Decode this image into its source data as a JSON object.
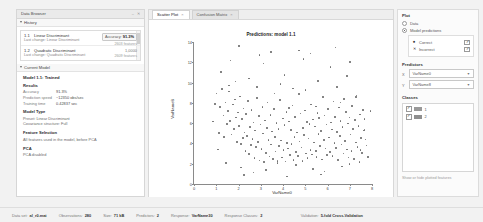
{
  "browser": {
    "title": "Data Browser",
    "history_header": "History",
    "history": [
      {
        "id": "1.1",
        "name": "Linear Discriminant",
        "sub_label": "Last change:",
        "sub_value": "Linear Discriminant",
        "accuracy_label": "Accuracy:",
        "accuracy_value": "91.3%",
        "features": "2603 features"
      },
      {
        "id": "1.2",
        "name": "Quadratic Discriminant",
        "sub_label": "Last change:",
        "sub_value": "Quadratic Discriminant",
        "accuracy_label": "",
        "accuracy_value": "1,0000",
        "features": "2609 features"
      }
    ],
    "current_model_header": "Current Model",
    "model_title": "Model 1.1: Trained",
    "results_header": "Results",
    "results": [
      {
        "key": "Accuracy",
        "value": "91.3%"
      },
      {
        "key": "Prediction speed",
        "value": "~12350 obs/sec"
      },
      {
        "key": "Training time",
        "value": "0.42837 sec"
      }
    ],
    "model_type_header": "Model Type",
    "model_type_lines": [
      "Preset: Linear Discriminant",
      "Covariance structure: Full"
    ],
    "feature_selection_header": "Feature Selection",
    "feature_selection_lines": [
      "All features used in the model, before PCA"
    ],
    "pca_header": "PCA",
    "pca_lines": [
      "PCA disabled"
    ]
  },
  "tabs": [
    {
      "label": "Scatter Plot",
      "close": "×",
      "active": true
    },
    {
      "label": "Confusion Matrix",
      "close": "×",
      "active": false
    }
  ],
  "chart_data": {
    "type": "scatter",
    "title": "Predictions: model 1.1",
    "xlabel": "VarName0",
    "ylabel": "VarName8",
    "xlim": [
      0,
      8
    ],
    "ylim": [
      0,
      14
    ],
    "xticks": [
      "0",
      "1",
      "2",
      "3",
      "4",
      "5",
      "6",
      "7",
      "8"
    ],
    "yticks": [
      "0",
      "2",
      "4",
      "6",
      "8",
      "10",
      "12",
      "14"
    ],
    "grid": false,
    "legend": "none",
    "series": [
      {
        "name": "Model predictions",
        "marker": "dot",
        "color": "#4a4a4a",
        "points": [
          [
            1.02,
            8.91
          ],
          [
            1.18,
            7.62
          ],
          [
            1.26,
            9.38
          ],
          [
            1.33,
            6.74
          ],
          [
            1.41,
            8.05
          ],
          [
            1.47,
            5.93
          ],
          [
            1.52,
            7.18
          ],
          [
            1.58,
            9.72
          ],
          [
            1.63,
            6.21
          ],
          [
            1.69,
            4.88
          ],
          [
            1.74,
            7.85
          ],
          [
            1.79,
            5.42
          ],
          [
            1.84,
            8.33
          ],
          [
            1.88,
            6.57
          ],
          [
            1.93,
            4.16
          ],
          [
            1.97,
            7.04
          ],
          [
            2.02,
            5.71
          ],
          [
            2.06,
            8.62
          ],
          [
            2.11,
            3.95
          ],
          [
            2.15,
            6.38
          ],
          [
            2.19,
            4.52
          ],
          [
            2.23,
            7.46
          ],
          [
            2.27,
            5.09
          ],
          [
            2.31,
            3.27
          ],
          [
            2.35,
            6.91
          ],
          [
            2.39,
            4.74
          ],
          [
            2.43,
            8.18
          ],
          [
            2.47,
            2.96
          ],
          [
            2.51,
            5.63
          ],
          [
            2.55,
            3.84
          ],
          [
            2.59,
            7.29
          ],
          [
            2.63,
            4.41
          ],
          [
            2.67,
            6.05
          ],
          [
            2.71,
            2.58
          ],
          [
            2.75,
            5.27
          ],
          [
            2.79,
            3.62
          ],
          [
            2.83,
            8.47
          ],
          [
            2.87,
            4.13
          ],
          [
            2.91,
            6.72
          ],
          [
            2.95,
            2.31
          ],
          [
            2.99,
            5.88
          ],
          [
            3.03,
            3.45
          ],
          [
            3.07,
            7.61
          ],
          [
            3.11,
            4.97
          ],
          [
            3.15,
            2.14
          ],
          [
            3.19,
            6.26
          ],
          [
            3.23,
            3.08
          ],
          [
            3.27,
            5.52
          ],
          [
            3.31,
            8.04
          ],
          [
            3.35,
            4.35
          ],
          [
            3.39,
            2.72
          ],
          [
            3.43,
            6.83
          ],
          [
            3.47,
            3.91
          ],
          [
            3.51,
            5.16
          ],
          [
            3.55,
            2.47
          ],
          [
            3.59,
            7.38
          ],
          [
            3.63,
            4.62
          ],
          [
            3.67,
            3.19
          ],
          [
            3.71,
            6.01
          ],
          [
            3.75,
            2.05
          ],
          [
            3.79,
            5.44
          ],
          [
            3.83,
            3.73
          ],
          [
            3.87,
            8.26
          ],
          [
            3.91,
            4.28
          ],
          [
            3.95,
            2.63
          ],
          [
            3.99,
            6.47
          ],
          [
            4.03,
            3.36
          ],
          [
            4.07,
            5.79
          ],
          [
            4.11,
            2.21
          ],
          [
            4.15,
            7.12
          ],
          [
            4.19,
            4.05
          ],
          [
            4.23,
            3.52
          ],
          [
            4.27,
            6.18
          ],
          [
            4.31,
            2.84
          ],
          [
            4.35,
            5.31
          ],
          [
            4.39,
            3.97
          ],
          [
            4.43,
            7.73
          ],
          [
            4.47,
            2.39
          ],
          [
            4.51,
            4.66
          ],
          [
            4.55,
            6.59
          ],
          [
            4.59,
            3.14
          ],
          [
            4.63,
            5.07
          ],
          [
            4.67,
            2.76
          ],
          [
            4.71,
            8.85
          ],
          [
            4.75,
            4.19
          ],
          [
            4.79,
            6.94
          ],
          [
            4.83,
            3.61
          ],
          [
            4.87,
            2.28
          ],
          [
            4.91,
            5.55
          ],
          [
            4.95,
            4.83
          ],
          [
            4.99,
            7.26
          ],
          [
            5.03,
            3.02
          ],
          [
            5.07,
            6.11
          ],
          [
            5.11,
            2.55
          ],
          [
            5.15,
            4.47
          ],
          [
            5.19,
            5.92
          ],
          [
            5.23,
            3.38
          ],
          [
            5.27,
            7.84
          ],
          [
            5.31,
            2.92
          ],
          [
            5.35,
            6.35
          ],
          [
            5.39,
            4.09
          ],
          [
            5.43,
            5.68
          ],
          [
            5.47,
            3.24
          ],
          [
            5.51,
            2.66
          ],
          [
            5.55,
            7.02
          ],
          [
            5.59,
            4.91
          ],
          [
            5.63,
            6.48
          ],
          [
            5.67,
            3.77
          ],
          [
            5.71,
            5.23
          ],
          [
            5.75,
            2.41
          ],
          [
            5.79,
            8.59
          ],
          [
            5.83,
            4.34
          ],
          [
            5.87,
            6.77
          ],
          [
            5.91,
            3.49
          ],
          [
            5.95,
            5.86
          ],
          [
            5.99,
            2.87
          ],
          [
            6.03,
            7.41
          ],
          [
            6.07,
            4.58
          ],
          [
            6.11,
            3.13
          ],
          [
            6.15,
            6.05
          ],
          [
            6.19,
            5.39
          ],
          [
            6.23,
            2.74
          ],
          [
            6.27,
            8.12
          ],
          [
            6.31,
            4.02
          ],
          [
            6.35,
            6.63
          ],
          [
            6.39,
            3.56
          ],
          [
            6.43,
            5.14
          ],
          [
            6.47,
            2.35
          ],
          [
            6.51,
            7.55
          ],
          [
            6.55,
            4.76
          ],
          [
            6.59,
            6.22
          ],
          [
            6.63,
            3.88
          ],
          [
            6.67,
            5.61
          ],
          [
            6.71,
            2.99
          ],
          [
            6.75,
            8.38
          ],
          [
            6.79,
            4.25
          ],
          [
            6.83,
            7.09
          ],
          [
            6.87,
            3.42
          ],
          [
            6.91,
            5.97
          ],
          [
            6.95,
            2.61
          ],
          [
            6.99,
            6.54
          ],
          [
            7.03,
            4.88
          ],
          [
            7.07,
            3.25
          ],
          [
            7.11,
            7.68
          ],
          [
            7.15,
            5.45
          ],
          [
            7.19,
            2.48
          ],
          [
            7.23,
            6.29
          ],
          [
            7.27,
            4.11
          ],
          [
            7.31,
            8.73
          ],
          [
            7.35,
            3.67
          ],
          [
            7.39,
            5.74
          ],
          [
            7.43,
            2.18
          ],
          [
            7.47,
            6.86
          ],
          [
            7.51,
            4.52
          ],
          [
            7.55,
            3.05
          ],
          [
            7.59,
            7.31
          ],
          [
            7.63,
            5.28
          ],
          [
            7.67,
            6.42
          ],
          [
            7.71,
            4.37
          ],
          [
            7.75,
            3.79
          ],
          [
            1.22,
            11.05
          ],
          [
            2.48,
            10.42
          ],
          [
            3.12,
            11.88
          ],
          [
            4.06,
            10.77
          ],
          [
            4.92,
            12.34
          ],
          [
            5.58,
            10.16
          ],
          [
            6.14,
            11.52
          ],
          [
            6.88,
            10.63
          ],
          [
            2.94,
            12.71
          ],
          [
            3.88,
            9.84
          ],
          [
            5.02,
            9.26
          ],
          [
            6.42,
            9.58
          ],
          [
            1.86,
            10.09
          ],
          [
            4.44,
            9.41
          ],
          [
            7.02,
            12.05
          ],
          [
            2.12,
            1.62
          ],
          [
            3.24,
            1.38
          ],
          [
            4.58,
            1.85
          ],
          [
            5.86,
            1.24
          ],
          [
            6.66,
            1.71
          ],
          [
            1.44,
            2.08
          ],
          [
            2.68,
            1.12
          ],
          [
            3.76,
            2.24
          ],
          [
            5.34,
            1.47
          ],
          [
            6.98,
            1.95
          ],
          [
            1.08,
            3.41
          ],
          [
            7.82,
            2.67
          ],
          [
            2.26,
            0.88
          ],
          [
            4.18,
            0.74
          ],
          [
            5.72,
            0.95
          ],
          [
            1.64,
            12.18
          ],
          [
            3.46,
            13.02
          ],
          [
            5.24,
            12.88
          ],
          [
            6.36,
            13.44
          ],
          [
            2.02,
            13.61
          ],
          [
            4.72,
            13.15
          ],
          [
            1.34,
            4.62
          ],
          [
            7.66,
            5.38
          ],
          [
            0.86,
            6.15
          ],
          [
            7.94,
            7.22
          ],
          [
            1.12,
            5.05
          ],
          [
            7.48,
            3.34
          ],
          [
            0.94,
            7.91
          ],
          [
            7.28,
            8.56
          ],
          [
            1.56,
            9.12
          ],
          [
            6.58,
            8.04
          ],
          [
            2.84,
            9.55
          ],
          [
            5.48,
            7.66
          ],
          [
            3.62,
            8.92
          ],
          [
            4.26,
            7.48
          ]
        ]
      }
    ]
  },
  "controls": {
    "plot_header": "Plot",
    "plot_options": [
      {
        "label": "Data",
        "selected": false
      },
      {
        "label": "Model predictions",
        "selected": true
      }
    ],
    "prediction_rows": [
      {
        "marker": "●",
        "label": "Correct",
        "checked": true
      },
      {
        "marker": "✕",
        "label": "Incorrect",
        "checked": true
      }
    ],
    "predictors_header": "Predictors",
    "predictor_selects": [
      {
        "axis": "X",
        "value": "VarName0",
        "caret": "▼"
      },
      {
        "axis": "Y",
        "value": "VarName8",
        "caret": "▼"
      }
    ],
    "classes_header": "Classes",
    "classes": [
      {
        "name": "1",
        "checked": true,
        "color": "#999999"
      },
      {
        "name": "2",
        "checked": true,
        "color": "#8f8f8f"
      }
    ],
    "hint": "Show or hide plotted features"
  },
  "status": [
    {
      "key": "Data set:",
      "value": "al_r0.mat"
    },
    {
      "key": "Observations:",
      "value": "280"
    },
    {
      "key": "Size:",
      "value": "71 kB"
    },
    {
      "key": "Predictors:",
      "value": "2"
    },
    {
      "key": "Response:",
      "value": "VarName30"
    },
    {
      "key": "Response Classes:",
      "value": "2"
    },
    {
      "key": "Validation:",
      "value": "5-fold Cross-Validation"
    }
  ],
  "window_controls": {
    "minimize": "–",
    "close": "✕"
  }
}
